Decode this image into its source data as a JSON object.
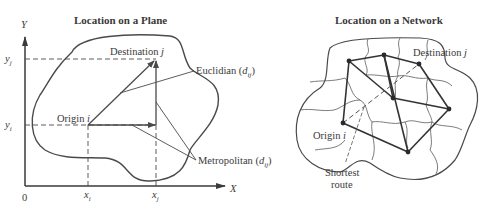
{
  "left_panel": {
    "title": "Location on a Plane",
    "y_axis_label": "Y",
    "x_axis_label": "X",
    "origin_label": "0",
    "y_ticks": [
      {
        "base": "y",
        "sub": "j"
      },
      {
        "base": "y",
        "sub": "i"
      }
    ],
    "x_ticks": [
      {
        "base": "x",
        "sub": "i"
      },
      {
        "base": "x",
        "sub": "j"
      }
    ],
    "origin_point": {
      "text": "Origin ",
      "var": "i"
    },
    "destination_point": {
      "text": "Destination ",
      "var": "j"
    },
    "euclidian": {
      "text": "Euclidian (",
      "var": "d",
      "sub": "ij",
      "close": ")"
    },
    "metropolitan": {
      "text": "Metropolitan (",
      "var": "d",
      "sub": "ij",
      "close": ")"
    }
  },
  "right_panel": {
    "title": "Location on a Network",
    "destination": {
      "text": "Destination ",
      "var": "j"
    },
    "origin": {
      "text": "Origin ",
      "var": "i"
    },
    "shortest_route": [
      "Shortest",
      "route"
    ]
  },
  "colors": {
    "line": "#3a3a3a",
    "background": "#ffffff"
  }
}
